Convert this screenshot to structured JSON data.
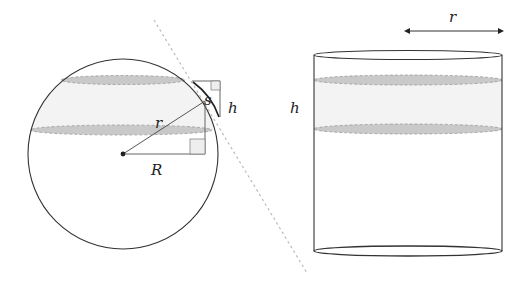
{
  "colors": {
    "stroke": "#333333",
    "band_fill": "#f2f2f2",
    "band_ellipse_fill": "#c8c8c8",
    "band_ellipse_stroke": "#9a9a9a",
    "tangent": "#bbbbbb",
    "right_angle_fill": "#eeeeee"
  },
  "sphere": {
    "labels": {
      "r": "r",
      "R": "R",
      "s": "s",
      "h": "h"
    }
  },
  "cylinder": {
    "labels": {
      "r": "r",
      "h": "h"
    }
  }
}
